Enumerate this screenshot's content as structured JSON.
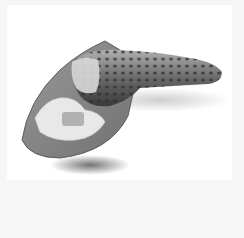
{
  "image": {
    "subject": "wasabi root on grater board with grated wasabi",
    "style": "grayscale product photo",
    "colors": {
      "background": "#f6f6f6",
      "photo_background": "#ffffff",
      "board": "#8a8a8a",
      "board_edge": "#6e6e6e",
      "root_dark": "#3c3c3c",
      "root_mid": "#7a7a7a",
      "grated": "#e6e6e6"
    }
  }
}
